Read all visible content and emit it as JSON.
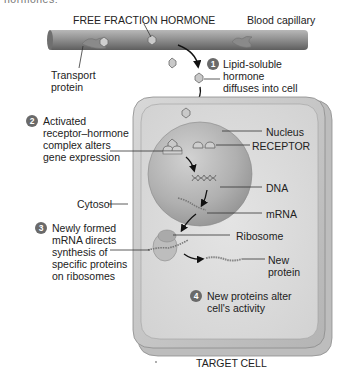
{
  "diagram": {
    "top_cropped_text": "hormones:",
    "capillary": {
      "title": "FREE FRACTION HORMONE",
      "label": "Blood capillary",
      "transport_protein_label": [
        "Transport",
        "protein"
      ]
    },
    "steps": [
      {
        "number": "1",
        "lines": [
          "Lipid-soluble",
          "hormone",
          "diffuses into cell"
        ]
      },
      {
        "number": "2",
        "lines": [
          "Activated",
          "receptor–hormone",
          "complex alters",
          "gene expression"
        ]
      },
      {
        "number": "3",
        "lines": [
          "Newly formed",
          "mRNA directs",
          "synthesis of",
          "specific proteins",
          "on ribosomes"
        ]
      },
      {
        "number": "4",
        "lines": [
          "New proteins alter",
          "cell's activity"
        ]
      }
    ],
    "cell_labels": {
      "nucleus": "Nucleus",
      "receptor": "RECEPTOR",
      "dna": "DNA",
      "mrna": "mRNA",
      "ribosome": "Ribosome",
      "new_protein": [
        "New",
        "protein"
      ],
      "cytosol": "Cytosol"
    },
    "target_cell_label": "TARGET CELL",
    "colors": {
      "badge": "#6a6a6a",
      "cell_outer": "#c9c9c9",
      "cell_inner": "#dcdcdc",
      "nucleus": "#a9a9a9",
      "capillary": "#8c8c8c",
      "leader_line": "#333333"
    }
  }
}
